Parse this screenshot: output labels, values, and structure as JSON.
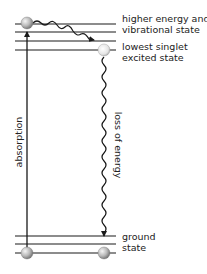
{
  "diagram": {
    "type": "jablonski-energy-level",
    "labels": {
      "upper_1": "higher energy and",
      "upper_2": "vibrational state",
      "mid_1": "lowest singlet",
      "mid_2": "excited state",
      "ground_1": "ground",
      "ground_2": "state",
      "absorption": "absorption",
      "loss": "loss of energy"
    },
    "colors": {
      "level_line": "#8c8c8c",
      "arrow": "#1a1a1a",
      "ball_light": "#f2f2f2",
      "ball_dark": "#8a8a8a"
    }
  }
}
